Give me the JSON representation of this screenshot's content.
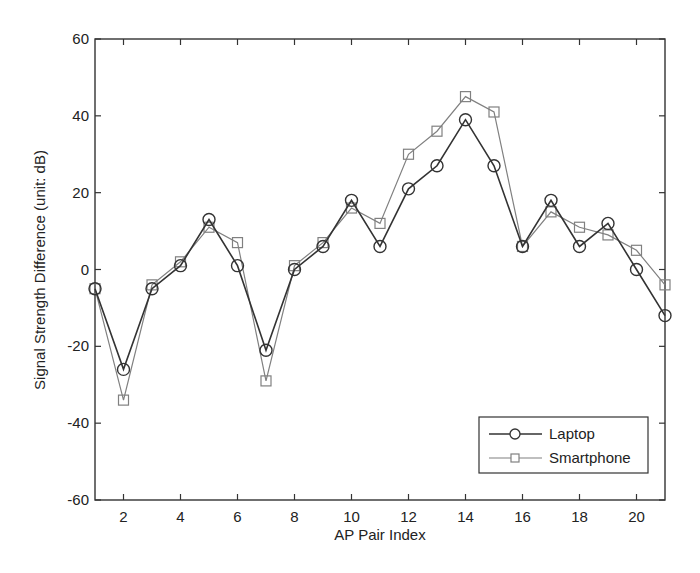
{
  "chart_data": {
    "type": "line",
    "title": "",
    "xlabel": "AP Pair Index",
    "ylabel": "Signal Strength Difference (unit: dB)",
    "xlim": [
      1,
      21
    ],
    "ylim": [
      -60,
      60
    ],
    "xticks": [
      2,
      4,
      6,
      8,
      10,
      12,
      14,
      16,
      18,
      20
    ],
    "yticks": [
      -60,
      -40,
      -20,
      0,
      20,
      40,
      60
    ],
    "grid": false,
    "legend_position": "lower right",
    "x": [
      1,
      2,
      3,
      4,
      5,
      6,
      7,
      8,
      9,
      10,
      11,
      12,
      13,
      14,
      15,
      16,
      17,
      18,
      19,
      20,
      21
    ],
    "series": [
      {
        "name": "Laptop",
        "marker": "circle",
        "color": "#333333",
        "values": [
          -5,
          -26,
          -5,
          1,
          13,
          1,
          -21,
          0,
          6,
          18,
          6,
          21,
          27,
          39,
          27,
          6,
          18,
          6,
          12,
          0,
          -12
        ]
      },
      {
        "name": "Smartphone",
        "marker": "square",
        "color": "#808080",
        "values": [
          -5,
          -34,
          -4,
          2,
          11,
          7,
          -29,
          1,
          7,
          16,
          12,
          30,
          36,
          45,
          41,
          6,
          15,
          11,
          9,
          5,
          -4
        ]
      }
    ]
  }
}
